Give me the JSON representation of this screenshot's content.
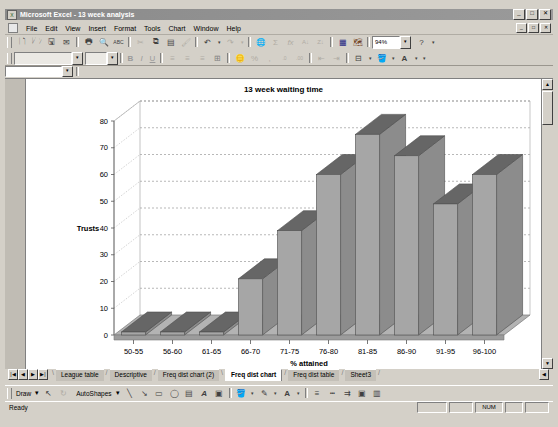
{
  "window": {
    "title": "Microsoft Excel - 13 week analysis",
    "app_icon": "excel-icon",
    "minimize": "_",
    "maximize": "□",
    "close": "✕",
    "doc_minimize": "_",
    "doc_restore": "□",
    "doc_close": "✕"
  },
  "menu": {
    "doc_icon": "document-icon",
    "items": [
      {
        "label": "File"
      },
      {
        "label": "Edit"
      },
      {
        "label": "View"
      },
      {
        "label": "Insert"
      },
      {
        "label": "Format"
      },
      {
        "label": "Tools"
      },
      {
        "label": "Chart"
      },
      {
        "label": "Window"
      },
      {
        "label": "Help"
      }
    ]
  },
  "standard_toolbar": {
    "buttons": [
      {
        "name": "new-icon",
        "glyph": "🗋"
      },
      {
        "name": "open-icon",
        "glyph": "🗁"
      },
      {
        "name": "save-icon",
        "glyph": "🖫"
      },
      {
        "name": "mail-icon",
        "glyph": "✉"
      },
      {
        "name": "print-icon",
        "glyph": "🖶"
      },
      {
        "name": "print-preview-icon",
        "glyph": "🔍"
      },
      {
        "name": "spelling-icon",
        "glyph": "ABC"
      },
      {
        "name": "cut-icon",
        "glyph": "✂"
      },
      {
        "name": "copy-icon",
        "glyph": "⧉"
      },
      {
        "name": "paste-icon",
        "glyph": "📋"
      },
      {
        "name": "format-painter-icon",
        "glyph": "🖌"
      },
      {
        "name": "undo-icon",
        "glyph": "↶"
      },
      {
        "name": "undo-dropdown-icon",
        "glyph": "▾"
      },
      {
        "name": "redo-icon",
        "glyph": "↷"
      },
      {
        "name": "redo-dropdown-icon",
        "glyph": "▾"
      },
      {
        "name": "hyperlink-icon",
        "glyph": "🌐"
      },
      {
        "name": "autosum-icon",
        "glyph": "Σ"
      },
      {
        "name": "paste-function-icon",
        "glyph": "fx"
      },
      {
        "name": "sort-ascending-icon",
        "glyph": "A↓"
      },
      {
        "name": "sort-descending-icon",
        "glyph": "Z↓"
      },
      {
        "name": "chart-wizard-icon",
        "glyph": "▦"
      },
      {
        "name": "map-icon",
        "glyph": "🗺"
      },
      {
        "name": "drawing-icon",
        "glyph": "✎"
      }
    ],
    "zoom_value": "94%",
    "zoom_dropdown_icon": "▾",
    "help_icon": "?"
  },
  "formatting_toolbar": {
    "font_name": "",
    "font_size": "",
    "font_dropdown_icon": "▾",
    "size_dropdown_icon": "▾",
    "bold": "B",
    "italic": "I",
    "underline": "U",
    "buttons": [
      {
        "name": "align-left-icon",
        "glyph": "≡"
      },
      {
        "name": "align-center-icon",
        "glyph": "≡"
      },
      {
        "name": "align-right-icon",
        "glyph": "≡"
      },
      {
        "name": "merge-center-icon",
        "glyph": "⊞"
      },
      {
        "name": "currency-icon",
        "glyph": "£"
      },
      {
        "name": "percent-icon",
        "glyph": "%"
      },
      {
        "name": "comma-icon",
        "glyph": ","
      },
      {
        "name": "increase-decimal-icon",
        "glyph": ".0"
      },
      {
        "name": "decrease-decimal-icon",
        "glyph": ".00"
      },
      {
        "name": "decrease-indent-icon",
        "glyph": "⇤"
      },
      {
        "name": "increase-indent-icon",
        "glyph": "⇥"
      },
      {
        "name": "borders-icon",
        "glyph": "⊞"
      },
      {
        "name": "fill-color-icon",
        "glyph": "🪣"
      },
      {
        "name": "font-color-icon",
        "glyph": "A"
      }
    ]
  },
  "formula_bar": {
    "name_box_value": "",
    "name_box_dropdown_icon": "▾",
    "formula_value": ""
  },
  "chart_data": {
    "type": "bar",
    "title": "13 week waiting time",
    "xlabel": "% attained",
    "ylabel": "Trusts",
    "categories": [
      "50-55",
      "56-60",
      "61-65",
      "66-70",
      "71-75",
      "76-80",
      "81-85",
      "86-90",
      "91-95",
      "96-100"
    ],
    "values": [
      0,
      0,
      0,
      21,
      39,
      60,
      75,
      67,
      49,
      60
    ],
    "ylim": [
      0,
      80
    ],
    "ytick_step": 10,
    "yticks": [
      "0",
      "10",
      "20",
      "30",
      "40",
      "50",
      "60",
      "70",
      "80"
    ],
    "grid": true,
    "legend": false,
    "three_d": true,
    "bar_face_color": "#a6a6a6",
    "bar_side_color": "#8c8c8c",
    "bar_top_color": "#666666",
    "plot_bg_color": "#ffffff",
    "grid_color": "#808080"
  },
  "sheet_tabs": {
    "nav_first_icon": "|◀",
    "nav_prev_icon": "◀",
    "nav_next_icon": "▶",
    "nav_last_icon": "▶|",
    "items": [
      {
        "label": "League table",
        "active": false
      },
      {
        "label": "Descriptive",
        "active": false
      },
      {
        "label": "Freq dist chart (2)",
        "active": false
      },
      {
        "label": "Freq dist chart",
        "active": true
      },
      {
        "label": "Freq dist table",
        "active": false
      },
      {
        "label": "Sheet3",
        "active": false
      }
    ],
    "scroll_left_icon": "◀",
    "scroll_right_icon": "▶"
  },
  "drawing_toolbar": {
    "draw_label": "Draw",
    "draw_dropdown_icon": "▾",
    "select-objects-icon": "↖",
    "free-rotate-icon": "↻",
    "autoshapes_label": "AutoShapes",
    "autoshapes_dropdown_icon": "▾",
    "buttons": [
      {
        "name": "line-icon",
        "glyph": "╲"
      },
      {
        "name": "arrow-icon",
        "glyph": "↘"
      },
      {
        "name": "rectangle-icon",
        "glyph": "▭"
      },
      {
        "name": "oval-icon",
        "glyph": "◯"
      },
      {
        "name": "text-box-icon",
        "glyph": "▤"
      },
      {
        "name": "wordart-icon",
        "glyph": "A"
      },
      {
        "name": "clip-art-icon",
        "glyph": "🖼"
      },
      {
        "name": "fill-color-icon",
        "glyph": "🪣"
      },
      {
        "name": "fill-dropdown-icon",
        "glyph": "▾"
      },
      {
        "name": "line-color-icon",
        "glyph": "✎"
      },
      {
        "name": "line-color-dropdown-icon",
        "glyph": "▾"
      },
      {
        "name": "font-color-icon",
        "glyph": "A"
      },
      {
        "name": "font-color-dropdown-icon",
        "glyph": "▾"
      },
      {
        "name": "line-style-icon",
        "glyph": "≡"
      },
      {
        "name": "dash-style-icon",
        "glyph": "┄"
      },
      {
        "name": "arrow-style-icon",
        "glyph": "⇉"
      },
      {
        "name": "shadow-icon",
        "glyph": "▣"
      },
      {
        "name": "3d-icon",
        "glyph": "▥"
      }
    ]
  },
  "status_bar": {
    "message": "Ready",
    "num_lock": "NUM"
  }
}
